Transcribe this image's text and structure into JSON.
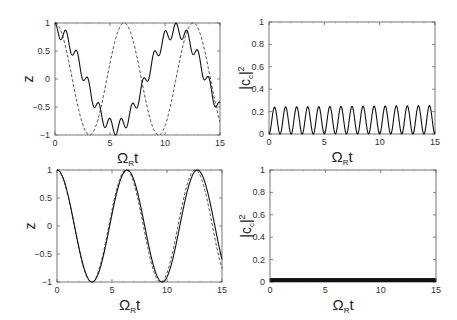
{
  "chart_data": [
    {
      "id": "top-left",
      "type": "line",
      "title": "",
      "xlabel": "Ω_R t",
      "ylabel": "z",
      "xlim": [
        0,
        15
      ],
      "ylim": [
        -1,
        1
      ],
      "xticks": [
        0,
        5,
        10,
        15
      ],
      "yticks": [
        -1,
        -0.5,
        0,
        0.5,
        1
      ],
      "grid": false,
      "frame": {
        "x0": 55,
        "y0": 23,
        "x1": 220,
        "y1": 135
      },
      "series": [
        {
          "name": "solid",
          "style": "solid",
          "model": "0.87*cos(0.57*t) + 0.13*cos(6.28*t)",
          "x": [
            0,
            0.5,
            1,
            1.5,
            2,
            2.5,
            3,
            3.5,
            4,
            4.5,
            5,
            5.5,
            6,
            6.5,
            7,
            7.5,
            8,
            8.5,
            9,
            9.5,
            10,
            10.5,
            11,
            11.5,
            12,
            12.5,
            13,
            13.5,
            14,
            14.5,
            15
          ],
          "y": [
            1.0,
            0.4,
            0.65,
            0.2,
            -0.15,
            -0.55,
            -0.85,
            -0.95,
            -0.95,
            -0.6,
            -0.4,
            0.1,
            0.4,
            0.5,
            0.97,
            0.6,
            0.85,
            0.3,
            0.15,
            -0.25,
            -0.6,
            -0.8,
            -1.0,
            -0.95,
            -0.65,
            -0.5,
            0.0,
            0.2,
            0.88,
            0.5,
            0.8
          ]
        },
        {
          "name": "dashed",
          "style": "dashed",
          "model": "cos(t)",
          "x": [
            0,
            1.57,
            3.14,
            4.71,
            6.28,
            7.85,
            9.42,
            11.0,
            12.57,
            14.14,
            15
          ],
          "y": [
            1,
            0,
            -1,
            0,
            1,
            0,
            -1,
            0,
            1,
            0,
            -0.76
          ]
        }
      ]
    },
    {
      "id": "top-right",
      "type": "line",
      "title": "",
      "xlabel": "Ω_R t",
      "ylabel": "|c_c|^2",
      "xlim": [
        0,
        15
      ],
      "ylim": [
        0,
        1
      ],
      "xticks": [
        0,
        5,
        10,
        15
      ],
      "yticks": [
        0,
        0.2,
        0.4,
        0.6,
        0.8,
        1
      ],
      "grid": false,
      "frame": {
        "x0": 269,
        "y0": 22,
        "x1": 435,
        "y1": 134
      },
      "series": [
        {
          "name": "solid",
          "style": "solid",
          "model": "0.24*sin^2(pi*t)",
          "peaks": 15,
          "peak_value": 0.24,
          "min_value": 0
        }
      ]
    },
    {
      "id": "bottom-left",
      "type": "line",
      "title": "",
      "xlabel": "Ω_R t",
      "ylabel": "z",
      "xlim": [
        0,
        15
      ],
      "ylim": [
        -1,
        1
      ],
      "xticks": [
        0,
        5,
        10,
        15
      ],
      "yticks": [
        -1,
        -0.5,
        0,
        0.5,
        1
      ],
      "grid": false,
      "frame": {
        "x0": 57,
        "y0": 170,
        "x1": 222,
        "y1": 282
      },
      "series": [
        {
          "name": "solid",
          "style": "solid",
          "model": "cos(0.985*t) + 0.02*cos(25*t)",
          "x": [
            0,
            3.2,
            6.4,
            9.6,
            12.75,
            15
          ],
          "y": [
            1,
            -1,
            1,
            -1,
            1,
            -0.6
          ]
        },
        {
          "name": "dashed",
          "style": "dashed",
          "model": "cos(t)",
          "x": [
            0,
            3.14,
            6.28,
            9.42,
            12.57,
            15
          ],
          "y": [
            1,
            -1,
            1,
            -1,
            1,
            -0.76
          ]
        }
      ]
    },
    {
      "id": "bottom-right",
      "type": "line",
      "title": "",
      "xlabel": "Ω_R t",
      "ylabel": "|c_c|^2",
      "xlim": [
        0,
        15
      ],
      "ylim": [
        0,
        1
      ],
      "xticks": [
        0,
        5,
        10,
        15
      ],
      "yticks": [
        0,
        0.2,
        0.4,
        0.6,
        0.8,
        1
      ],
      "grid": false,
      "frame": {
        "x0": 270,
        "y0": 170,
        "x1": 436,
        "y1": 282
      },
      "series": [
        {
          "name": "solid",
          "style": "solid",
          "model": "0.03*sin^2(fast oscillation)",
          "peak_value": 0.03,
          "min_value": 0
        }
      ]
    }
  ],
  "labels": {
    "x_main": "Ω",
    "x_sub": "R",
    "x_tail": "t",
    "y_z": "z",
    "y_c_main": "|c",
    "y_c_sub": "c",
    "y_c_tail": "|",
    "y_c_sup": "2"
  }
}
